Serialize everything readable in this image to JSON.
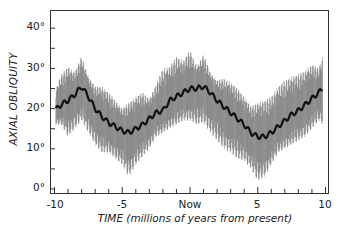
{
  "chart_data": {
    "type": "line",
    "title": "",
    "xlabel": "TIME (millions of years from present)",
    "ylabel": "AXIAL OBLIQUITY",
    "xlim": [
      -10,
      10
    ],
    "ylim": [
      0,
      44
    ],
    "grid": false,
    "legend": null,
    "x_ticks": [
      {
        "value": -10,
        "label": "-10"
      },
      {
        "value": -5,
        "label": "-5"
      },
      {
        "value": 0,
        "label": "Now"
      },
      {
        "value": 5,
        "label": "5"
      },
      {
        "value": 10,
        "label": "10"
      }
    ],
    "x_minor_step": 1,
    "y_ticks": [
      {
        "value": 0,
        "label": "0°"
      },
      {
        "value": 10,
        "label": "10°"
      },
      {
        "value": 20,
        "label": "20°"
      },
      {
        "value": 30,
        "label": "30°"
      },
      {
        "value": 40,
        "label": "40°"
      }
    ],
    "y_minor_step": 5,
    "series": [
      {
        "name": "mean obliquity",
        "x": [
          -10,
          -9.5,
          -9,
          -8.5,
          -8,
          -7.5,
          -7,
          -6.5,
          -6,
          -5.5,
          -5,
          -4.5,
          -4,
          -3.5,
          -3,
          -2.5,
          -2,
          -1.5,
          -1,
          -0.5,
          0,
          0.5,
          1,
          1.5,
          2,
          2.5,
          3,
          3.5,
          4,
          4.5,
          5,
          5.5,
          6,
          6.5,
          7,
          7.5,
          8,
          8.5,
          9,
          9.5,
          9.8
        ],
        "y": [
          19.5,
          21,
          22,
          23.5,
          25.5,
          23,
          20,
          18,
          16.5,
          15.5,
          14.5,
          14,
          15,
          16,
          17.5,
          19,
          19.5,
          22,
          23,
          24,
          25,
          25,
          25.5,
          24,
          22,
          20.5,
          19,
          17.5,
          16,
          14,
          13,
          13,
          14,
          15.5,
          17,
          18.5,
          19.5,
          21,
          22.5,
          24,
          25
        ]
      },
      {
        "name": "max envelope",
        "x": [
          -10,
          -9.5,
          -9,
          -8.5,
          -8,
          -7.5,
          -7,
          -6.5,
          -6,
          -5.5,
          -5,
          -4.5,
          -4,
          -3.5,
          -3,
          -2.5,
          -2,
          -1.5,
          -1,
          -0.5,
          0,
          0.5,
          1,
          1.5,
          2,
          2.5,
          3,
          3.5,
          4,
          4.5,
          5,
          5.5,
          6,
          6.5,
          7,
          7.5,
          8,
          8.5,
          9,
          9.5,
          9.8
        ],
        "y": [
          24,
          28.5,
          30.5,
          29,
          33,
          28,
          25.5,
          25.5,
          24,
          22,
          20,
          21.5,
          23,
          24,
          22.5,
          26,
          30,
          30.5,
          33,
          32,
          34.5,
          30.5,
          33.5,
          29,
          27,
          27.5,
          26.5,
          25,
          23,
          20.5,
          21.5,
          22,
          23,
          25.5,
          27,
          28,
          28.5,
          29.5,
          31,
          30,
          33
        ]
      },
      {
        "name": "min envelope",
        "x": [
          -10,
          -9.5,
          -9,
          -8.5,
          -8,
          -7.5,
          -7,
          -6.5,
          -6,
          -5.5,
          -5,
          -4.5,
          -4,
          -3.5,
          -3,
          -2.5,
          -2,
          -1.5,
          -1,
          -0.5,
          0,
          0.5,
          1,
          1.5,
          2,
          2.5,
          3,
          3.5,
          4,
          4.5,
          5,
          5.5,
          6,
          6.5,
          7,
          7.5,
          8,
          8.5,
          9,
          9.5,
          9.8
        ],
        "y": [
          16,
          16,
          13,
          15,
          17,
          14,
          11,
          9,
          9,
          7.5,
          6,
          3,
          6,
          8,
          10,
          13,
          14,
          15,
          16,
          17,
          17,
          16,
          16.5,
          14,
          12,
          10,
          9,
          7.5,
          7,
          5,
          2,
          3,
          6,
          9,
          10,
          11,
          12,
          13,
          15,
          17,
          16
        ]
      }
    ],
    "oscillation_period_myr": 0.041
  }
}
